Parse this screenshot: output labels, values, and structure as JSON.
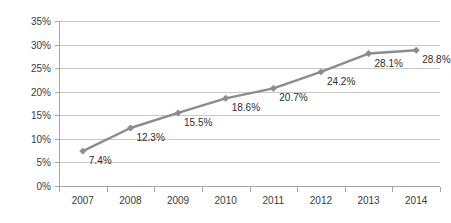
{
  "chart_data": {
    "type": "line",
    "title": "",
    "xlabel": "",
    "ylabel": "",
    "categories": [
      "2007",
      "2008",
      "2009",
      "2010",
      "2011",
      "2012",
      "2013",
      "2014"
    ],
    "values": [
      7.4,
      12.3,
      15.5,
      18.6,
      20.7,
      24.2,
      28.1,
      28.8
    ],
    "data_labels": [
      "7.4%",
      "12.3%",
      "15.5%",
      "18.6%",
      "20.7%",
      "24.2%",
      "28.1%",
      "28.8%"
    ],
    "ylim": [
      0,
      35
    ],
    "ytick_values": [
      0,
      5,
      10,
      15,
      20,
      25,
      30,
      35
    ],
    "ytick_labels": [
      "0%",
      "5%",
      "10%",
      "15%",
      "20%",
      "25%",
      "30%",
      "35%"
    ],
    "grid": true,
    "grid_axis": "y",
    "legend": false,
    "series": [
      {
        "name": "",
        "color": "#8c8c8c",
        "marker": "diamond",
        "values": [
          7.4,
          12.3,
          15.5,
          18.6,
          20.7,
          24.2,
          28.1,
          28.8
        ]
      }
    ],
    "colors": {
      "line": "#8c8c8c",
      "gridline": "#c8c8c8",
      "axis": "#a6a6a6",
      "tick_text": "#3a3a3a",
      "label_text": "#2e2e2e",
      "background": "#ffffff"
    },
    "plot_area": {
      "left": 59,
      "right": 440,
      "top": 21,
      "bottom": 186
    },
    "label_offsets": {
      "dx": 6,
      "dy": 13
    }
  }
}
